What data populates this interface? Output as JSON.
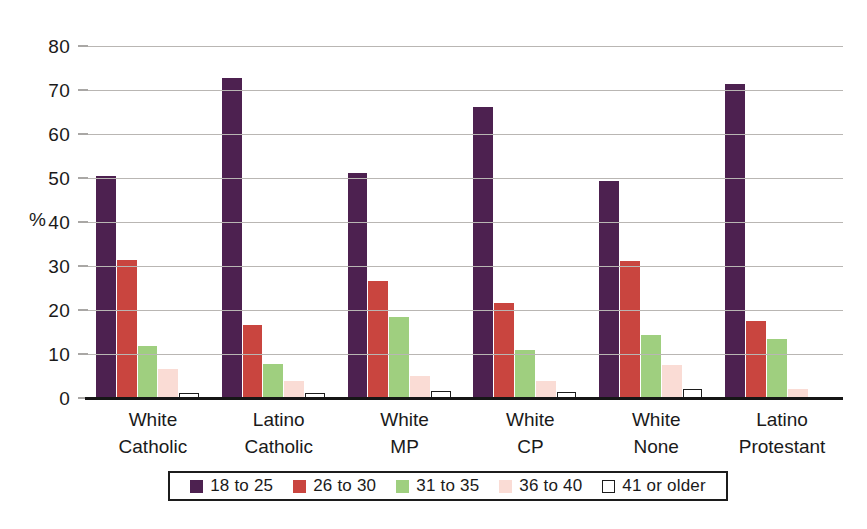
{
  "chart_data": {
    "type": "bar",
    "title": "",
    "subtitle": "",
    "xlabel": "",
    "ylabel": "%",
    "ylim": [
      0,
      80
    ],
    "yticks": [
      0,
      10,
      20,
      30,
      40,
      50,
      60,
      70,
      80
    ],
    "grid": true,
    "legend_position": "bottom",
    "categories": [
      "White Catholic",
      "Latino Catholic",
      "White MP",
      "White CP",
      "White None",
      "Latino Protestant"
    ],
    "category_lines": [
      [
        "White",
        "Catholic"
      ],
      [
        "Latino",
        "Catholic"
      ],
      [
        "White",
        "MP"
      ],
      [
        "White",
        "CP"
      ],
      [
        "White",
        "None"
      ],
      [
        "Latino",
        "Protestant"
      ]
    ],
    "series": [
      {
        "name": "18 to 25",
        "color": "#4d2150",
        "values": [
          50.5,
          72.8,
          51.2,
          66.2,
          49.4,
          71.4
        ]
      },
      {
        "name": "26 to 30",
        "color": "#c9453f",
        "values": [
          31.4,
          16.5,
          26.6,
          21.5,
          31.1,
          17.6
        ]
      },
      {
        "name": "31 to 35",
        "color": "#9fcf7f",
        "values": [
          11.9,
          7.7,
          18.4,
          10.9,
          14.4,
          13.3
        ]
      },
      {
        "name": "36 to 40",
        "color": "#fadcd5",
        "values": [
          6.6,
          3.8,
          5.0,
          3.9,
          7.5,
          2.1
        ]
      },
      {
        "name": "41 or older",
        "color": "#ffffff",
        "values": [
          0.6,
          1.0,
          1.5,
          1.4,
          2.0,
          0.0
        ]
      }
    ]
  },
  "legend": {
    "items": [
      {
        "label": "18 to 25",
        "swatch": "filled"
      },
      {
        "label": "26 to 30",
        "swatch": "filled"
      },
      {
        "label": "31 to 35",
        "swatch": "filled"
      },
      {
        "label": "36 to 40",
        "swatch": "filled"
      },
      {
        "label": "41 or older",
        "swatch": "open"
      }
    ]
  },
  "colors": {
    "series_1": "#4d2150",
    "series_2": "#c9453f",
    "series_3": "#9fcf7f",
    "series_4": "#fadcd5",
    "series_5": "#ffffff",
    "gridline": "#b9b6b3",
    "axis": "#161616",
    "text": "#1a1a1a"
  }
}
